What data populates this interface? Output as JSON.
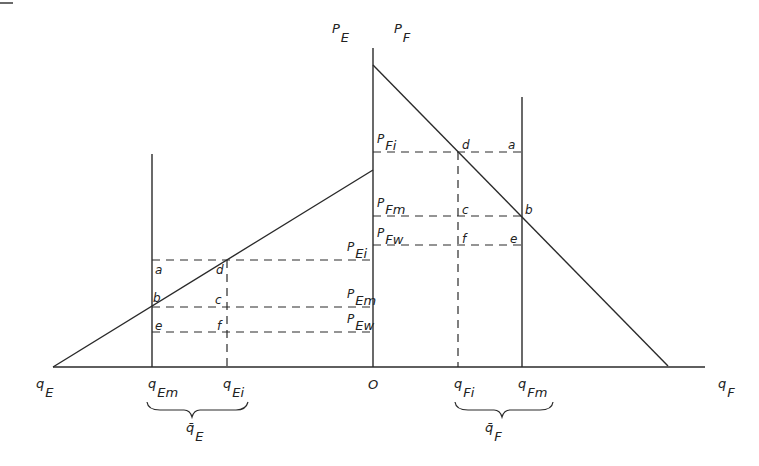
{
  "diagram": {
    "axes": {
      "origin": "O",
      "left_axis_label": {
        "main": "q",
        "sub": "E"
      },
      "right_axis_label": {
        "main": "q",
        "sub": "F"
      },
      "left_price_label": {
        "main": "P",
        "sub": "E"
      },
      "right_price_label": {
        "main": "P",
        "sub": "F"
      }
    },
    "E_side": {
      "quantity_ticks": [
        {
          "main": "q",
          "sub": "Em"
        },
        {
          "main": "q",
          "sub": "Ei"
        }
      ],
      "brace_label": {
        "main": "q̄",
        "sub": "E"
      },
      "price_levels": [
        {
          "main": "P",
          "sub": "Ei"
        },
        {
          "main": "P",
          "sub": "Em"
        },
        {
          "main": "P",
          "sub": "Ew"
        }
      ],
      "points": [
        "a",
        "b",
        "c",
        "d",
        "e",
        "f"
      ]
    },
    "F_side": {
      "quantity_ticks": [
        {
          "main": "q",
          "sub": "Fi"
        },
        {
          "main": "q",
          "sub": "Fm"
        }
      ],
      "brace_label": {
        "main": "q̄",
        "sub": "F"
      },
      "price_levels": [
        {
          "main": "P",
          "sub": "Fi"
        },
        {
          "main": "P",
          "sub": "Fm"
        },
        {
          "main": "P",
          "sub": "Fw"
        }
      ],
      "points": [
        "a",
        "b",
        "c",
        "d",
        "e",
        "f"
      ]
    },
    "colors": {
      "line": "#2a2a2a",
      "background": "#ffffff"
    }
  }
}
